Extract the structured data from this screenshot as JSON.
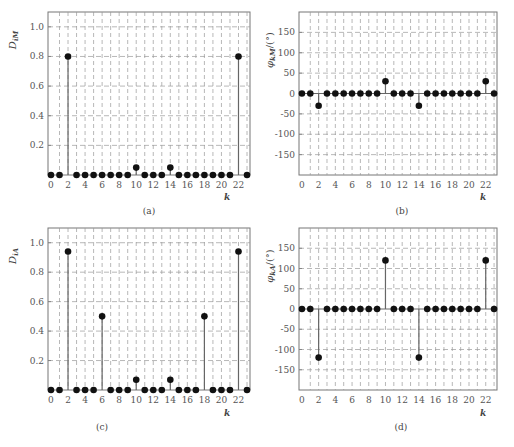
{
  "chart_data": [
    {
      "id": "a",
      "type": "stem",
      "caption": "(a)",
      "ylabel": "D_{i̇M}",
      "xlabel": "k",
      "xlim": [
        0,
        23
      ],
      "ylim": [
        0,
        1.1
      ],
      "yticks": [
        0.2,
        0.4,
        0.6,
        0.8,
        1.0
      ],
      "ytick_labels": [
        "0.2",
        "0.4",
        "0.6",
        "0.8",
        "1.0"
      ],
      "xticks": [
        0,
        2,
        4,
        6,
        8,
        10,
        12,
        14,
        16,
        18,
        20,
        22
      ],
      "grid": true,
      "x": [
        0,
        1,
        2,
        3,
        4,
        5,
        6,
        7,
        8,
        9,
        10,
        11,
        12,
        13,
        14,
        15,
        16,
        17,
        18,
        19,
        20,
        21,
        22,
        23
      ],
      "values": [
        0,
        0,
        0.8,
        0,
        0,
        0,
        0,
        0,
        0,
        0,
        0.05,
        0,
        0,
        0,
        0.05,
        0,
        0,
        0,
        0,
        0,
        0,
        0,
        0.8,
        0
      ]
    },
    {
      "id": "b",
      "type": "stem",
      "caption": "(b)",
      "ylabel": "φ_{kM}/(°)",
      "xlabel": "k",
      "xlim": [
        0,
        23
      ],
      "ylim": [
        -200,
        200
      ],
      "yticks": [
        -150,
        -100,
        -50,
        0,
        50,
        100,
        150
      ],
      "ytick_labels": [
        "-150",
        "-100",
        "-50",
        "0",
        "50",
        "100",
        "150"
      ],
      "xticks": [
        0,
        2,
        4,
        6,
        8,
        10,
        12,
        14,
        16,
        18,
        20,
        22
      ],
      "grid": true,
      "x": [
        0,
        1,
        2,
        3,
        4,
        5,
        6,
        7,
        8,
        9,
        10,
        11,
        12,
        13,
        14,
        15,
        16,
        17,
        18,
        19,
        20,
        21,
        22,
        23
      ],
      "values": [
        0,
        0,
        -30,
        0,
        0,
        0,
        0,
        0,
        0,
        0,
        30,
        0,
        0,
        0,
        -30,
        0,
        0,
        0,
        0,
        0,
        0,
        0,
        30,
        0
      ]
    },
    {
      "id": "c",
      "type": "stem",
      "caption": "(c)",
      "ylabel": "D_{i̇A}",
      "xlabel": "k",
      "xlim": [
        0,
        23
      ],
      "ylim": [
        0,
        1.1
      ],
      "yticks": [
        0.2,
        0.4,
        0.6,
        0.8,
        1.0
      ],
      "ytick_labels": [
        "0.2",
        "0.4",
        "0.6",
        "0.8",
        "1.0"
      ],
      "xticks": [
        0,
        2,
        4,
        6,
        8,
        10,
        12,
        14,
        16,
        18,
        20,
        22
      ],
      "grid": true,
      "x": [
        0,
        1,
        2,
        3,
        4,
        5,
        6,
        7,
        8,
        9,
        10,
        11,
        12,
        13,
        14,
        15,
        16,
        17,
        18,
        19,
        20,
        21,
        22,
        23
      ],
      "values": [
        0,
        0,
        0.94,
        0,
        0,
        0,
        0.5,
        0,
        0,
        0,
        0.07,
        0,
        0,
        0,
        0.07,
        0,
        0,
        0,
        0.5,
        0,
        0,
        0,
        0.94,
        0
      ]
    },
    {
      "id": "d",
      "type": "stem",
      "caption": "(d)",
      "ylabel": "φ_{kA}/(°)",
      "xlabel": "k",
      "xlim": [
        0,
        23
      ],
      "ylim": [
        -200,
        200
      ],
      "yticks": [
        -150,
        -100,
        -50,
        0,
        50,
        100,
        150
      ],
      "ytick_labels": [
        "-150",
        "-100",
        "-50",
        "0",
        "50",
        "100",
        "150"
      ],
      "xticks": [
        0,
        2,
        4,
        6,
        8,
        10,
        12,
        14,
        16,
        18,
        20,
        22
      ],
      "grid": true,
      "x": [
        0,
        1,
        2,
        3,
        4,
        5,
        6,
        7,
        8,
        9,
        10,
        11,
        12,
        13,
        14,
        15,
        16,
        17,
        18,
        19,
        20,
        21,
        22,
        23
      ],
      "values": [
        0,
        0,
        -120,
        0,
        0,
        0,
        0,
        0,
        0,
        0,
        120,
        0,
        0,
        0,
        -120,
        0,
        0,
        0,
        0,
        0,
        0,
        0,
        120,
        0
      ]
    }
  ],
  "captions": {
    "a": "(a)",
    "b": "(b)",
    "c": "(c)",
    "d": "(d)"
  },
  "k_label": "k"
}
